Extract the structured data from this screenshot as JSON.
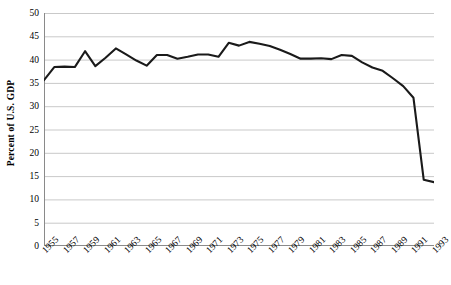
{
  "chart_data": {
    "type": "line",
    "title": "",
    "xlabel": "",
    "ylabel": "Percent of U.S. GDP",
    "xlim": [
      1955,
      1993
    ],
    "ylim": [
      0,
      50
    ],
    "ytick_step": 5,
    "grid": true,
    "legend": "none",
    "line_color": "#1a1a1a",
    "gridline_color": "#c9c9c9",
    "axis_color": "#808080",
    "background": "#ffffff",
    "ytick_labels": [
      "0",
      "5",
      "10",
      "15",
      "20",
      "25",
      "30",
      "35",
      "40",
      "45",
      "50"
    ],
    "ytick_values": [
      0,
      5,
      10,
      15,
      20,
      25,
      30,
      35,
      40,
      45,
      50
    ],
    "xtick_labels": [
      "1955",
      "1957",
      "1959",
      "1961",
      "1963",
      "1965",
      "1967",
      "1969",
      "1971",
      "1973",
      "1975",
      "1977",
      "1979",
      "1981",
      "1983",
      "1985",
      "1987",
      "1989",
      "1991",
      "1993"
    ],
    "xtick_values": [
      1955,
      1957,
      1959,
      1961,
      1963,
      1965,
      1967,
      1969,
      1971,
      1973,
      1975,
      1977,
      1979,
      1981,
      1983,
      1985,
      1987,
      1989,
      1991,
      1993
    ],
    "minor_ticks_every": 1,
    "x": [
      1955,
      1956,
      1957,
      1958,
      1959,
      1960,
      1961,
      1962,
      1963,
      1964,
      1965,
      1966,
      1967,
      1968,
      1969,
      1970,
      1971,
      1972,
      1973,
      1974,
      1975,
      1976,
      1977,
      1978,
      1979,
      1980,
      1981,
      1982,
      1983,
      1984,
      1985,
      1986,
      1987,
      1988,
      1989,
      1990,
      1991,
      1992,
      1993
    ],
    "values": [
      35.6,
      38.4,
      38.5,
      38.4,
      41.8,
      38.6,
      40.4,
      42.4,
      41.1,
      39.8,
      38.7,
      41.0,
      41.0,
      40.2,
      40.6,
      41.1,
      41.1,
      40.6,
      43.6,
      43.0,
      43.8,
      43.4,
      42.9,
      42.1,
      41.2,
      40.2,
      40.2,
      40.3,
      40.1,
      41.0,
      40.8,
      39.4,
      38.3,
      37.6,
      36.0,
      34.3,
      31.8,
      14.2,
      13.7
    ]
  }
}
